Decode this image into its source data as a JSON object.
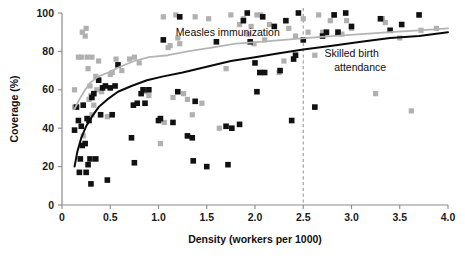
{
  "chart_data": {
    "type": "scatter",
    "title": "",
    "xlabel": "Density (workers per 1000)",
    "ylabel": "Coverage (%)",
    "xlim": [
      0,
      4.0
    ],
    "ylim": [
      0,
      100
    ],
    "xticks": [
      "0",
      "0.5",
      "1.0",
      "1.5",
      "2.0",
      "2.5",
      "3.0",
      "3.5",
      "4.0"
    ],
    "xtick_values": [
      0,
      0.5,
      1.0,
      1.5,
      2.0,
      2.5,
      3.0,
      3.5,
      4.0
    ],
    "yticks": [
      "0",
      "20",
      "40",
      "60",
      "80",
      "100"
    ],
    "ytick_values": [
      0,
      20,
      40,
      60,
      80,
      100
    ],
    "grid": false,
    "legend_position": "inline-annotations",
    "annotations": [
      {
        "text": "Measles immunization",
        "x": 1.18,
        "y": 88,
        "series": "measles-immunization",
        "align": "start"
      },
      {
        "text": "Skilled birth",
        "x": 2.72,
        "y": 77,
        "series": "skilled-birth-attendance",
        "align": "start"
      },
      {
        "text": "attendance",
        "x": 2.82,
        "y": 70,
        "series": "skilled-birth-attendance",
        "align": "start"
      }
    ],
    "reference_lines": [
      {
        "name": "density-threshold",
        "orientation": "vertical",
        "x": 2.5,
        "style": "dashed",
        "color": "#9a9a9a"
      }
    ],
    "series": [
      {
        "name": "Measles immunization",
        "id": "measles-immunization",
        "marker": "square",
        "color": "#b0b0b0",
        "marker_size": 2.6,
        "points": [
          [
            0.13,
            51
          ],
          [
            0.13,
            60
          ],
          [
            0.17,
            77
          ],
          [
            0.2,
            77
          ],
          [
            0.21,
            90
          ],
          [
            0.22,
            36
          ],
          [
            0.24,
            88
          ],
          [
            0.25,
            92
          ],
          [
            0.26,
            77
          ],
          [
            0.27,
            71
          ],
          [
            0.28,
            55
          ],
          [
            0.29,
            62
          ],
          [
            0.3,
            57
          ],
          [
            0.31,
            77
          ],
          [
            0.31,
            47
          ],
          [
            0.33,
            52
          ],
          [
            0.35,
            67
          ],
          [
            0.36,
            60
          ],
          [
            0.38,
            75
          ],
          [
            0.41,
            59
          ],
          [
            0.47,
            46
          ],
          [
            0.5,
            68
          ],
          [
            0.52,
            69
          ],
          [
            0.56,
            76
          ],
          [
            0.62,
            70
          ],
          [
            0.7,
            76
          ],
          [
            0.75,
            77
          ],
          [
            0.8,
            74
          ],
          [
            0.86,
            59
          ],
          [
            0.9,
            57
          ],
          [
            1.02,
            32
          ],
          [
            1.05,
            98
          ],
          [
            1.06,
            43
          ],
          [
            1.1,
            82
          ],
          [
            1.12,
            83
          ],
          [
            1.15,
            56
          ],
          [
            1.18,
            99
          ],
          [
            1.2,
            87
          ],
          [
            1.22,
            84
          ],
          [
            1.26,
            58
          ],
          [
            1.3,
            55
          ],
          [
            1.35,
            47
          ],
          [
            1.38,
            98
          ],
          [
            1.45,
            53
          ],
          [
            1.52,
            97
          ],
          [
            1.63,
            40
          ],
          [
            1.7,
            71
          ],
          [
            1.75,
            99
          ],
          [
            1.84,
            94
          ],
          [
            1.88,
            97
          ],
          [
            1.93,
            89
          ],
          [
            1.96,
            93
          ],
          [
            1.99,
            84
          ],
          [
            2.02,
            99
          ],
          [
            2.06,
            99
          ],
          [
            2.1,
            86
          ],
          [
            2.15,
            94
          ],
          [
            2.25,
            69
          ],
          [
            2.3,
            75
          ],
          [
            2.35,
            92
          ],
          [
            2.42,
            88
          ],
          [
            2.5,
            97
          ],
          [
            2.55,
            90
          ],
          [
            2.62,
            78
          ],
          [
            2.66,
            99
          ],
          [
            2.7,
            90
          ],
          [
            2.74,
            89
          ],
          [
            2.78,
            96
          ],
          [
            2.82,
            99
          ],
          [
            2.86,
            90
          ],
          [
            2.9,
            89
          ],
          [
            2.95,
            96
          ],
          [
            3.0,
            92
          ],
          [
            3.25,
            58
          ],
          [
            3.32,
            97
          ],
          [
            3.35,
            95
          ],
          [
            3.5,
            87
          ],
          [
            3.62,
            49
          ],
          [
            3.72,
            91
          ],
          [
            3.88,
            92
          ]
        ]
      },
      {
        "name": "Skilled birth attendance",
        "id": "skilled-birth-attendance",
        "marker": "square",
        "color": "#111111",
        "marker_size": 2.8,
        "points": [
          [
            0.13,
            39
          ],
          [
            0.15,
            51
          ],
          [
            0.17,
            44
          ],
          [
            0.18,
            17
          ],
          [
            0.19,
            24
          ],
          [
            0.2,
            41
          ],
          [
            0.21,
            31
          ],
          [
            0.22,
            52
          ],
          [
            0.24,
            32
          ],
          [
            0.25,
            17
          ],
          [
            0.26,
            45
          ],
          [
            0.27,
            21
          ],
          [
            0.28,
            44
          ],
          [
            0.29,
            24
          ],
          [
            0.3,
            11
          ],
          [
            0.31,
            56
          ],
          [
            0.33,
            58
          ],
          [
            0.35,
            24
          ],
          [
            0.38,
            65
          ],
          [
            0.4,
            47
          ],
          [
            0.42,
            61
          ],
          [
            0.45,
            62
          ],
          [
            0.47,
            13
          ],
          [
            0.5,
            61
          ],
          [
            0.52,
            47
          ],
          [
            0.55,
            62
          ],
          [
            0.58,
            73
          ],
          [
            0.72,
            35
          ],
          [
            0.74,
            52
          ],
          [
            0.75,
            22
          ],
          [
            0.78,
            53
          ],
          [
            0.82,
            58
          ],
          [
            0.84,
            60
          ],
          [
            0.86,
            53
          ],
          [
            0.9,
            60
          ],
          [
            1.0,
            44
          ],
          [
            1.02,
            45
          ],
          [
            1.05,
            86
          ],
          [
            1.15,
            43
          ],
          [
            1.2,
            59
          ],
          [
            1.22,
            98
          ],
          [
            1.3,
            36
          ],
          [
            1.35,
            35
          ],
          [
            1.36,
            23
          ],
          [
            1.38,
            54
          ],
          [
            1.5,
            20
          ],
          [
            1.6,
            85
          ],
          [
            1.7,
            41
          ],
          [
            1.72,
            21
          ],
          [
            1.76,
            40
          ],
          [
            1.84,
            42
          ],
          [
            1.88,
            96
          ],
          [
            1.92,
            100
          ],
          [
            1.95,
            85
          ],
          [
            2.0,
            74
          ],
          [
            2.02,
            59
          ],
          [
            2.05,
            69
          ],
          [
            2.08,
            98
          ],
          [
            2.1,
            69
          ],
          [
            2.2,
            93
          ],
          [
            2.26,
            70
          ],
          [
            2.32,
            96
          ],
          [
            2.38,
            44
          ],
          [
            2.4,
            76
          ],
          [
            2.42,
            78
          ],
          [
            2.45,
            100
          ],
          [
            2.5,
            86
          ],
          [
            2.62,
            51
          ],
          [
            2.7,
            88
          ],
          [
            2.74,
            90
          ],
          [
            2.82,
            99
          ],
          [
            2.86,
            90
          ],
          [
            2.94,
            100
          ],
          [
            3.0,
            93
          ],
          [
            3.3,
            97
          ],
          [
            3.4,
            91
          ],
          [
            3.52,
            94
          ],
          [
            3.7,
            99
          ]
        ]
      }
    ],
    "trend_curves": [
      {
        "name": "Measles immunization trend",
        "id": "trend-measles",
        "color": "#b4b4b4",
        "points": [
          [
            0.13,
            50
          ],
          [
            0.18,
            55
          ],
          [
            0.24,
            60
          ],
          [
            0.3,
            64
          ],
          [
            0.38,
            67
          ],
          [
            0.48,
            69
          ],
          [
            0.6,
            72
          ],
          [
            0.75,
            75
          ],
          [
            0.9,
            77
          ],
          [
            1.1,
            78
          ],
          [
            1.3,
            80
          ],
          [
            1.55,
            82
          ],
          [
            1.8,
            84
          ],
          [
            2.05,
            85
          ],
          [
            2.3,
            86
          ],
          [
            2.55,
            87
          ],
          [
            2.8,
            88
          ],
          [
            3.1,
            89
          ],
          [
            3.4,
            90
          ],
          [
            3.7,
            91
          ],
          [
            4.0,
            92
          ]
        ]
      },
      {
        "name": "Skilled birth attendance trend",
        "id": "trend-skilled-birth",
        "color": "#0a0a0a",
        "points": [
          [
            0.13,
            20
          ],
          [
            0.16,
            28
          ],
          [
            0.2,
            35
          ],
          [
            0.25,
            41
          ],
          [
            0.31,
            46
          ],
          [
            0.38,
            51
          ],
          [
            0.47,
            55
          ],
          [
            0.58,
            59
          ],
          [
            0.72,
            62
          ],
          [
            0.88,
            65
          ],
          [
            1.05,
            67
          ],
          [
            1.25,
            69
          ],
          [
            1.5,
            72
          ],
          [
            1.75,
            75
          ],
          [
            2.0,
            77
          ],
          [
            2.25,
            79
          ],
          [
            2.5,
            81
          ],
          [
            2.8,
            83
          ],
          [
            3.1,
            85
          ],
          [
            3.4,
            87
          ],
          [
            3.7,
            88
          ],
          [
            4.0,
            90
          ]
        ]
      }
    ]
  }
}
